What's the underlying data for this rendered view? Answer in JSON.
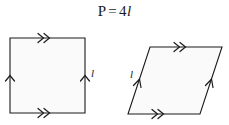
{
  "figure": {
    "formula": {
      "lhs": "P",
      "equals": "=",
      "coefficient": "4",
      "variable": "l",
      "full_text": "P = 4l"
    },
    "stroke_color": "#1a1a1a",
    "fill_color": "#fafafa",
    "background_color": "#ffffff",
    "shapes": [
      {
        "name": "square",
        "label_text": "l",
        "edges": [
          {
            "position": "top",
            "tick_marks": 2,
            "direction": "right"
          },
          {
            "position": "bottom",
            "tick_marks": 2,
            "direction": "right"
          },
          {
            "position": "left",
            "tick_marks": 1,
            "direction": "up"
          },
          {
            "position": "right",
            "tick_marks": 1,
            "direction": "up",
            "label": "l"
          }
        ]
      },
      {
        "name": "parallelogram",
        "label_text": "l",
        "edges": [
          {
            "position": "top",
            "tick_marks": 2,
            "direction": "right"
          },
          {
            "position": "bottom",
            "tick_marks": 2,
            "direction": "right"
          },
          {
            "position": "left",
            "tick_marks": 1,
            "direction": "up-right",
            "label": "l"
          },
          {
            "position": "right",
            "tick_marks": 1,
            "direction": "up-right"
          }
        ]
      }
    ]
  }
}
